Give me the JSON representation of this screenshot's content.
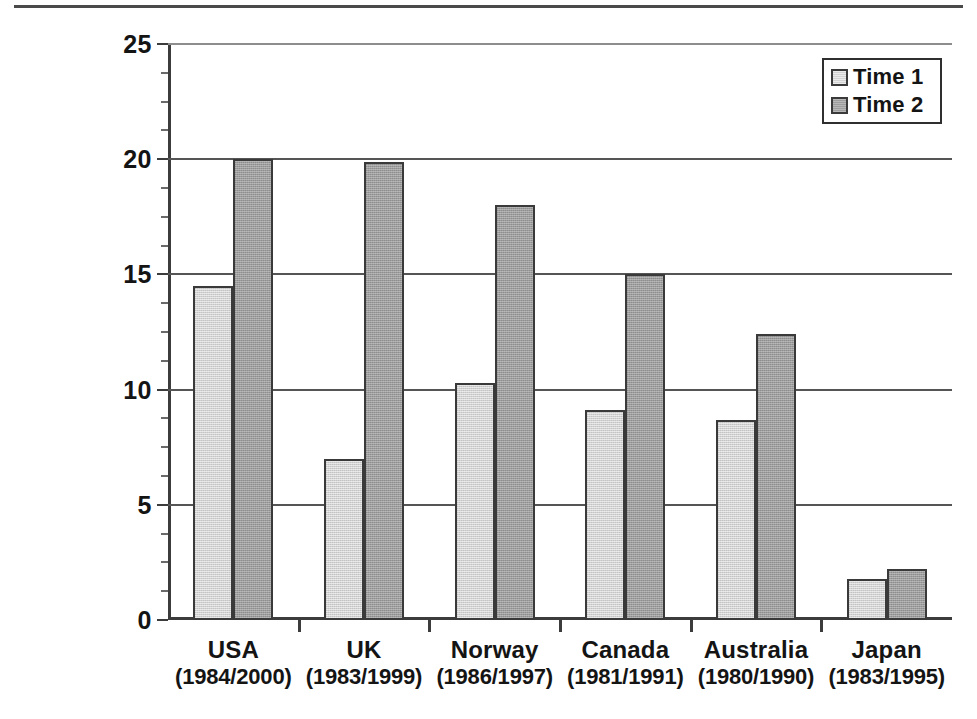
{
  "chart_data": {
    "type": "bar",
    "title": "",
    "xlabel": "",
    "ylabel": "% Obese (BMI ≥ 30)",
    "ylim": [
      0,
      25
    ],
    "ytick_labels": [
      "0",
      "5",
      "10",
      "15",
      "20",
      "25"
    ],
    "ytick_values": [
      0,
      5,
      10,
      15,
      20,
      25
    ],
    "yminor_step": 1.25,
    "grid": "horizontal",
    "legend_position": "top-right",
    "categories": [
      "USA",
      "UK",
      "Norway",
      "Canada",
      "Australia",
      "Japan"
    ],
    "category_sublabels": [
      "(1984/2000)",
      "(1983/1999)",
      "(1986/1997)",
      "(1981/1991)",
      "(1980/1990)",
      "(1983/1995)"
    ],
    "series": [
      {
        "name": "Time 1",
        "color": "#d2d2d2",
        "values": [
          14.5,
          7.0,
          10.3,
          9.1,
          8.7,
          1.8
        ]
      },
      {
        "name": "Time 2",
        "color": "#9d9d9d",
        "values": [
          20.0,
          19.9,
          18.0,
          15.0,
          12.4,
          2.2
        ]
      }
    ]
  },
  "legend": {
    "entries": [
      {
        "label": "Time 1"
      },
      {
        "label": "Time 2"
      }
    ]
  },
  "axes": {
    "y_title": "% Obese (BMI ≥ 30)"
  },
  "colors": {
    "time1_fill": "#d2d2d2",
    "time2_fill": "#9d9d9d",
    "bar_outline": "#3a3a3a",
    "axis": "#3c3c3c",
    "gridline": "#555555",
    "text": "#141414",
    "background": "#ffffff"
  }
}
